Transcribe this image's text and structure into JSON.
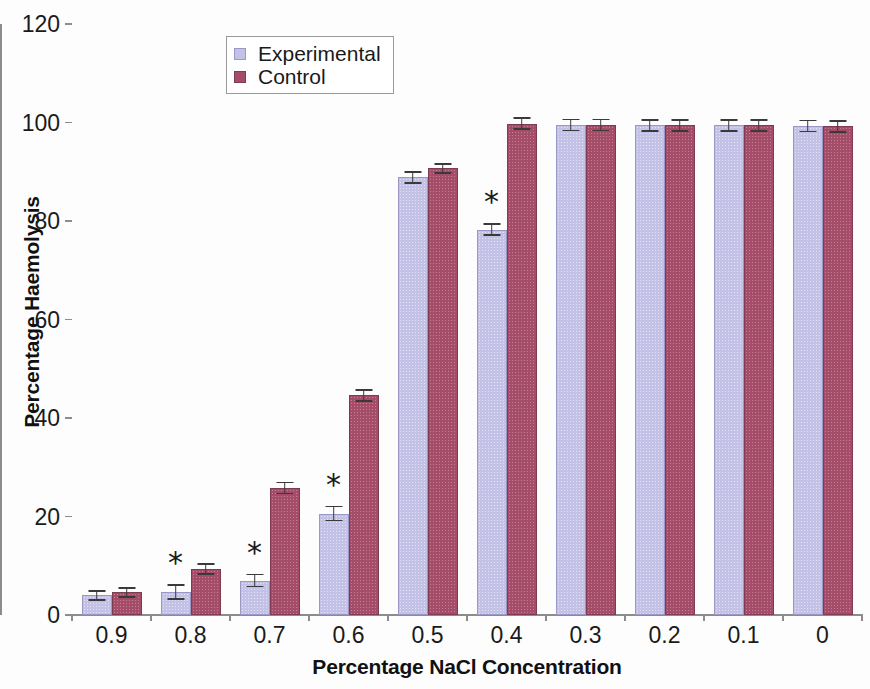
{
  "chart_data": {
    "type": "bar",
    "title": "",
    "xlabel": "Percentage NaCl Concentration",
    "ylabel": "Percentage Haemolysis",
    "categories": [
      "0.9",
      "0.8",
      "0.7",
      "0.6",
      "0.5",
      "0.4",
      "0.3",
      "0.2",
      "0.1",
      "0"
    ],
    "ylim": [
      0,
      120
    ],
    "yticks": [
      0,
      20,
      40,
      60,
      80,
      100,
      120
    ],
    "ytick_labels": [
      "0",
      "20",
      "40",
      "60",
      "80",
      "100",
      "120"
    ],
    "grid": false,
    "legend_position": "top-center-left",
    "series": [
      {
        "name": "Experimental",
        "color": "#c4c1e7",
        "values": [
          4.0,
          4.7,
          7.0,
          20.6,
          88.9,
          78.2,
          99.5,
          99.4,
          99.4,
          99.3
        ],
        "errors": [
          1.1,
          1.6,
          1.4,
          1.6,
          1.3,
          1.3,
          1.3,
          1.3,
          1.3,
          1.3
        ]
      },
      {
        "name": "Control",
        "color": "#a54c68",
        "values": [
          4.6,
          9.3,
          25.8,
          44.6,
          90.7,
          99.8,
          99.5,
          99.4,
          99.4,
          99.2
        ],
        "errors": [
          1.1,
          1.2,
          1.3,
          1.3,
          1.1,
          1.3,
          1.3,
          1.3,
          1.3,
          1.3
        ]
      }
    ],
    "annotations": [
      {
        "text": "*",
        "category": "0.8",
        "series": "Experimental"
      },
      {
        "text": "*",
        "category": "0.7",
        "series": "Experimental"
      },
      {
        "text": "*",
        "category": "0.6",
        "series": "Experimental"
      },
      {
        "text": "*",
        "category": "0.4",
        "series": "Experimental"
      }
    ]
  },
  "legend": {
    "entries": [
      {
        "label": "Experimental",
        "swatch": "experimental"
      },
      {
        "label": "Control",
        "swatch": "control"
      }
    ]
  }
}
